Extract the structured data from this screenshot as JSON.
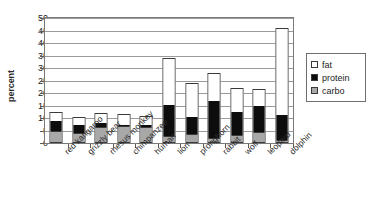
{
  "chart_data": {
    "type": "bar",
    "subtype": "stacked",
    "title": "",
    "xlabel": "",
    "ylabel": "percent",
    "ylim": [
      0,
      50
    ],
    "ytick_step": 5,
    "yticks": [
      0,
      5,
      10,
      15,
      20,
      25,
      30,
      35,
      40,
      45,
      50
    ],
    "grid": true,
    "legend_position": "right",
    "categories": [
      "red kangaroo",
      "grizzly bear",
      "rhesus monkey",
      "chimpanzee",
      "human",
      "lion",
      "pronghorn",
      "rabbit",
      "wolf",
      "leopard",
      "dolphin"
    ],
    "series": [
      {
        "name": "carbo",
        "color": "#a8a8a8",
        "values": [
          4.5,
          4.0,
          6.5,
          7.0,
          6.5,
          2.5,
          3.5,
          1.5,
          3.0,
          4.0,
          1.0
        ]
      },
      {
        "name": "protein",
        "color": "#0d0d0d",
        "values": [
          4.5,
          3.5,
          1.5,
          0.5,
          1.0,
          12.5,
          7.0,
          15.5,
          9.5,
          11.0,
          10.0
        ]
      },
      {
        "name": "fat",
        "color": "#ffffff",
        "values": [
          3.5,
          3.0,
          4.0,
          4.0,
          3.5,
          19.0,
          13.5,
          11.0,
          9.5,
          6.5,
          35.0
        ]
      }
    ],
    "totals": [
      12.5,
      10.5,
      12.0,
      11.5,
      11.0,
      34.0,
      24.0,
      28.0,
      22.0,
      21.5,
      46.0
    ]
  },
  "legend": {
    "items": [
      {
        "label": "fat",
        "swatch": "sw-fat"
      },
      {
        "label": "protein",
        "swatch": "sw-protein"
      },
      {
        "label": "carbo",
        "swatch": "sw-carbo"
      }
    ]
  },
  "axis": {
    "y_title": "percent"
  }
}
